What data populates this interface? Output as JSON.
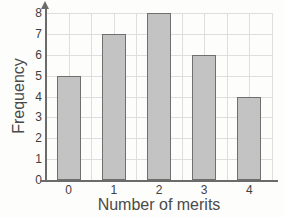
{
  "chart_data": {
    "type": "bar",
    "title": "",
    "subtitle": "",
    "categories": [
      "0",
      "1",
      "2",
      "3",
      "4"
    ],
    "values": [
      5,
      7,
      8,
      6,
      4
    ],
    "xlabel": "Number of merits",
    "ylabel": "Frequency",
    "ylim": [
      0,
      8
    ],
    "ytick_labels": [
      "8",
      "7",
      "6",
      "5",
      "4",
      "3",
      "2",
      "1",
      "0"
    ],
    "ytick_values": [
      8,
      7,
      6,
      5,
      4,
      3,
      2,
      1,
      0
    ],
    "xtick_labels": [
      "0",
      "1",
      "2",
      "3",
      "4"
    ],
    "grid": true,
    "legend": null,
    "annotations": [],
    "colors": {
      "bar_fill": "#c3c3c3",
      "bar_border": "#6f6f6f",
      "gridline": "#dedede",
      "axis_line": "#6b6b6b",
      "tick_text": "#3f3f3f",
      "axis_title_text": "#4a4a4a",
      "background": "#fdfdfc"
    }
  }
}
